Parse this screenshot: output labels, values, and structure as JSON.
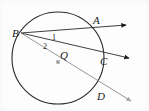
{
  "figure": {
    "type": "circle-geometry-diagram",
    "background_color": "#fdfdfd",
    "stroke_color": "#2a2a2a",
    "secant_color": "#7b7b7b",
    "center_dot_color": "#9a9a9a",
    "circle": {
      "center_label": "Q",
      "cx": 58,
      "cy": 58,
      "r": 46
    },
    "points": [
      {
        "name": "point-label-b",
        "label": "B",
        "x": 12,
        "y": 37,
        "marker_x": 21,
        "marker_y": 33
      },
      {
        "name": "point-label-a",
        "label": "A",
        "x": 93,
        "y": 24,
        "marker_x": 89,
        "marker_y": 27
      },
      {
        "name": "point-label-c",
        "label": "C",
        "x": 100,
        "y": 65,
        "marker_x": 99,
        "marker_y": 57
      },
      {
        "name": "point-label-d",
        "label": "D",
        "x": 97,
        "y": 100,
        "marker_x": 93,
        "marker_y": 92
      },
      {
        "name": "center-label-q",
        "label": "Q",
        "x": 60,
        "y": 59,
        "marker_x": 58,
        "marker_y": 62
      }
    ],
    "angles": [
      {
        "name": "angle-label-1",
        "label": "1",
        "x": 52,
        "y": 40
      },
      {
        "name": "angle-label-2",
        "label": "2",
        "x": 43,
        "y": 49
      }
    ],
    "rays": [
      {
        "name": "ray-b-to-a",
        "from": "B",
        "through": "A",
        "x1": 21,
        "y1": 33,
        "x2": 126,
        "y2": 25,
        "color": "#2a2a2a",
        "arrow": true
      },
      {
        "name": "ray-b-to-c",
        "from": "B",
        "through": "C",
        "x1": 21,
        "y1": 33,
        "x2": 129,
        "y2": 58,
        "color": "#2a2a2a",
        "arrow": true
      },
      {
        "name": "ray-b-through-q-to-d",
        "from": "B",
        "through": "D",
        "x1": 21,
        "y1": 33,
        "x2": 131,
        "y2": 101,
        "color": "#8c8c8c",
        "arrow": true
      }
    ]
  }
}
